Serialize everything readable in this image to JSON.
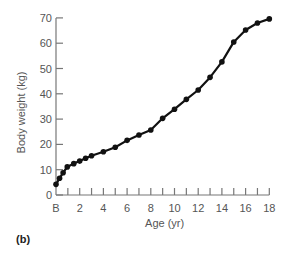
{
  "panel_label": "(b)",
  "chart_data": {
    "type": "line",
    "title": "",
    "xlabel": "Age (yr)",
    "ylabel": "Body weight (kg)",
    "xlim": [
      0,
      18
    ],
    "ylim": [
      0,
      70
    ],
    "x_tick_labels": [
      "B",
      "2",
      "4",
      "6",
      "8",
      "10",
      "12",
      "14",
      "16",
      "18"
    ],
    "x_tick_values": [
      0,
      2,
      4,
      6,
      8,
      10,
      12,
      14,
      16,
      18
    ],
    "x_minor_ticks_every": 1,
    "y_tick_values": [
      0,
      10,
      20,
      30,
      40,
      50,
      60,
      70
    ],
    "y_tick_labels": [
      "0",
      "10",
      "20",
      "30",
      "40",
      "50",
      "60",
      "70"
    ],
    "grid": false,
    "legend": null,
    "series": [
      {
        "name": "Body weight",
        "marker": "circle",
        "color": "#111111",
        "x": [
          0,
          0.3,
          0.6,
          0.95,
          1.5,
          2,
          2.5,
          3,
          4,
          5,
          6,
          7,
          8,
          9,
          10,
          11,
          12,
          13,
          14,
          15,
          16,
          17,
          18
        ],
        "y": [
          4.2,
          6.6,
          8.8,
          11.1,
          12.4,
          13.4,
          14.5,
          15.5,
          17.1,
          18.9,
          21.6,
          23.7,
          25.7,
          30.3,
          33.9,
          37.8,
          41.5,
          46.5,
          52.6,
          60.5,
          65.2,
          68,
          69.6
        ]
      }
    ]
  }
}
